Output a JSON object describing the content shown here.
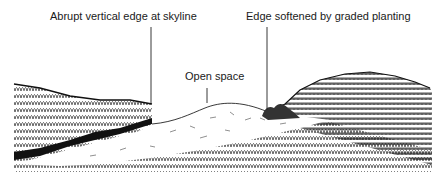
{
  "diagram": {
    "type": "landscape-section-sketch",
    "labels": [
      {
        "id": "abrupt-edge",
        "text": "Abrupt vertical edge at skyline"
      },
      {
        "id": "open-space",
        "text": "Open space"
      },
      {
        "id": "softened-edge",
        "text": "Edge softened by graded planting"
      }
    ]
  }
}
